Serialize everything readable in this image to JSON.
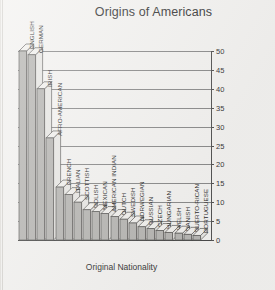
{
  "chart_data": {
    "type": "bar",
    "title": "Origins of Americans",
    "xlabel": "Original Nationality",
    "ylabel": "Population (Millions)",
    "ylim": [
      0,
      50
    ],
    "ytick_step": 5,
    "yticks": [
      "0",
      "5",
      "10",
      "15",
      "20",
      "25",
      "30",
      "35",
      "40",
      "45",
      "50"
    ],
    "grid": true,
    "legend": "none",
    "style": "3d-isometric-bars",
    "bar_color": "#b9b8b5",
    "bar_outline_color": "#5d5c5a",
    "categories": [
      "ENGLISH",
      "GERMAN",
      "IRISH",
      "AFRO-AMERICAN",
      "FRENCH",
      "ITALIAN",
      "SCOTTISH",
      "POLISH",
      "MEXICAN",
      "AMERICAN INDIAN",
      "DUTCH",
      "SWEDISH",
      "NORWEGIAN",
      "RUSSIAN",
      "CZECH",
      "HUNGARIAN",
      "WELSH",
      "DANISH",
      "PUERTO-RICAN",
      "PORTUGUESE"
    ],
    "values": [
      50,
      49,
      40,
      27,
      14,
      12,
      10,
      8,
      7.5,
      7,
      6.2,
      5.5,
      4.5,
      3.5,
      3,
      2.5,
      2,
      1.8,
      1.5,
      1.2
    ]
  }
}
